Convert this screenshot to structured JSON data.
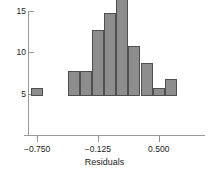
{
  "chart_data": {
    "type": "bar",
    "title": "",
    "subtitle": "",
    "xlabel": "Residuals",
    "ylabel": "",
    "grid": false,
    "legend": null,
    "bin_width": 0.125,
    "xlim": [
      -0.8125,
      0.6875
    ],
    "ylim": [
      0,
      15.8
    ],
    "x_ticks": [
      {
        "value": -0.75,
        "label": "−0.750"
      },
      {
        "value": -0.125,
        "label": "−0.125"
      },
      {
        "value": 0.5,
        "label": "0.500"
      }
    ],
    "y_ticks": [
      {
        "value": 5,
        "label": "5"
      },
      {
        "value": 10,
        "label": "10"
      },
      {
        "value": 15,
        "label": "15"
      }
    ],
    "bins": [
      {
        "left": -0.8125,
        "right": -0.6875,
        "center": -0.75,
        "count": 1
      },
      {
        "left": -0.6875,
        "right": -0.5625,
        "center": -0.625,
        "count": 0
      },
      {
        "left": -0.5625,
        "right": -0.4375,
        "center": -0.5,
        "count": 0
      },
      {
        "left": -0.4375,
        "right": -0.3125,
        "center": -0.375,
        "count": 3
      },
      {
        "left": -0.3125,
        "right": -0.1875,
        "center": -0.25,
        "count": 3
      },
      {
        "left": -0.1875,
        "right": -0.0625,
        "center": -0.125,
        "count": 8
      },
      {
        "left": -0.0625,
        "right": 0.0625,
        "center": 0.0,
        "count": 10
      },
      {
        "left": 0.0625,
        "right": 0.1875,
        "center": 0.125,
        "count": 15
      },
      {
        "left": 0.1875,
        "right": 0.3125,
        "center": 0.25,
        "count": 6
      },
      {
        "left": 0.3125,
        "right": 0.4375,
        "center": 0.375,
        "count": 4
      },
      {
        "left": 0.4375,
        "right": 0.5625,
        "center": 0.5,
        "count": 1
      },
      {
        "left": 0.5625,
        "right": 0.6875,
        "center": 0.625,
        "count": 2
      }
    ],
    "categories": [
      "-0.750",
      "-0.625",
      "-0.500",
      "-0.375",
      "-0.250",
      "-0.125",
      "0.000",
      "0.125",
      "0.250",
      "0.375",
      "0.500",
      "0.625"
    ],
    "values": [
      1,
      0,
      0,
      3,
      3,
      8,
      10,
      15,
      6,
      4,
      1,
      2
    ],
    "colors": {
      "bar_fill": "#8d8d8d",
      "bar_stroke": "#4f4f4f",
      "axis": "#9a9a9a",
      "text": "#1a1a1a",
      "background": "#ffffff"
    }
  }
}
